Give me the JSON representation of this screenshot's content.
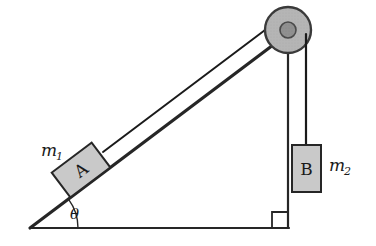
{
  "figure": {
    "type": "physics-diagram",
    "background_color": "#ffffff"
  },
  "colors": {
    "stroke": "#262626",
    "block_fill": "#c9c9c9",
    "pulley_fill": "#b5b5b5",
    "pulley_hub_fill": "#8f8f8f",
    "rope": "#1a1a1a",
    "text": "#1a1a1a"
  },
  "geometry": {
    "incline_angle_deg": 37,
    "apex": {
      "x": 30,
      "y": 228
    },
    "corner_right": {
      "x": 288,
      "y": 228
    },
    "corner_top": {
      "x": 288,
      "y": 30
    },
    "pulley_center": {
      "x": 288,
      "y": 30
    },
    "pulley_outer_radius": 23,
    "pulley_hub_radius": 8,
    "rope_vertical_x": 306
  },
  "labels": {
    "mass_one": {
      "base": "m",
      "subscript": "1"
    },
    "mass_two": {
      "base": "m",
      "subscript": "2"
    },
    "angle": "θ",
    "block_a": "A",
    "block_b": "B"
  },
  "blocks": [
    {
      "id": "block-a",
      "letter": "A",
      "mass_label_base": "m",
      "mass_label_sub": "1",
      "position": "on-incline",
      "center": {
        "x": 81,
        "y": 170
      },
      "width": 50,
      "height": 31,
      "rotation_deg": -37
    },
    {
      "id": "block-b",
      "letter": "B",
      "mass_label_base": "m",
      "mass_label_sub": "2",
      "position": "hanging",
      "x": 292,
      "y": 145,
      "width": 29,
      "height": 47
    }
  ],
  "annotations": {
    "right_angle_marker": {
      "x": 272,
      "y": 212,
      "size": 16
    },
    "angle_arc_label": "θ"
  }
}
